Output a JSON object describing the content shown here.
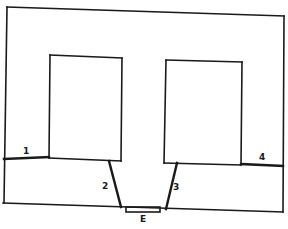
{
  "diagram": {
    "type": "floor-plan",
    "line_color": "#1a1a1a",
    "background": "#ffffff",
    "labels": {
      "wall_1": "1",
      "wall_2": "2",
      "wall_3": "3",
      "wall_4": "4",
      "entrance": "E"
    },
    "elements": [
      {
        "id": "outer-boundary",
        "kind": "room-outline"
      },
      {
        "id": "left-block",
        "kind": "inner-rectangle"
      },
      {
        "id": "right-block",
        "kind": "inner-rectangle"
      },
      {
        "id": "wall-1",
        "kind": "partition",
        "label": "1"
      },
      {
        "id": "wall-2",
        "kind": "partition",
        "label": "2"
      },
      {
        "id": "wall-3",
        "kind": "partition",
        "label": "3"
      },
      {
        "id": "wall-4",
        "kind": "partition",
        "label": "4"
      },
      {
        "id": "entrance",
        "kind": "door",
        "label": "E"
      }
    ]
  }
}
